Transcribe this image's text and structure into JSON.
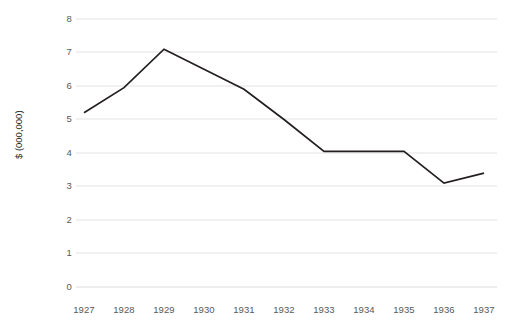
{
  "chart_data": {
    "type": "line",
    "title": "",
    "subtitle": "",
    "xlabel": "",
    "ylabel": "$ (000,000)",
    "categories": [
      "1927",
      "1928",
      "1929",
      "1930",
      "1931",
      "1932",
      "1933",
      "1934",
      "1935",
      "1936",
      "1937"
    ],
    "x": [
      1927,
      1928,
      1929,
      1930,
      1931,
      1932,
      1933,
      1934,
      1935,
      1936,
      1937
    ],
    "values": [
      5.2,
      5.95,
      7.1,
      6.5,
      5.9,
      5.0,
      4.05,
      4.05,
      4.05,
      3.1,
      3.4
    ],
    "series": [
      {
        "name": "",
        "values": [
          5.2,
          5.95,
          7.1,
          6.5,
          5.9,
          5.0,
          4.05,
          4.05,
          4.05,
          3.1,
          3.4
        ]
      }
    ],
    "ylim": [
      0,
      8
    ],
    "yticks": [
      0,
      1,
      2,
      3,
      4,
      5,
      6,
      7,
      8
    ],
    "ytick_labels": [
      "0",
      "1",
      "2",
      "3",
      "4",
      "5",
      "6",
      "7",
      "8"
    ],
    "grid": "horizontal",
    "legend": "none",
    "markers": false,
    "line_color": "#231f20",
    "grid_color": "#e3e3e3",
    "tick_label_color": "#58595b",
    "background_color": "#ffffff"
  }
}
